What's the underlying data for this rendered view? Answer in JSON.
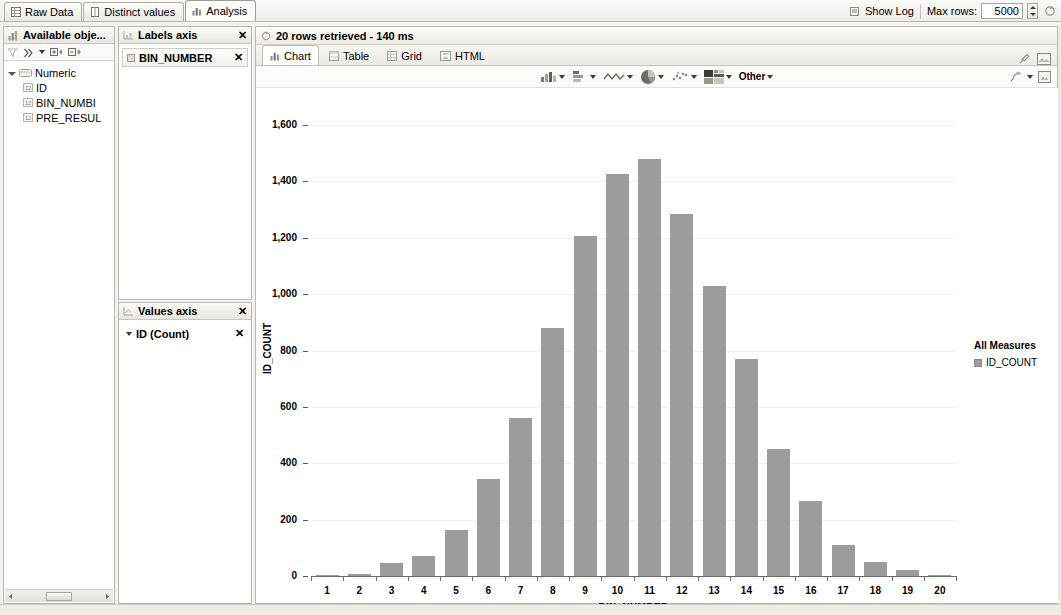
{
  "window": {
    "tabs": [
      {
        "label": "Raw Data",
        "icon": "grid-icon",
        "active": false
      },
      {
        "label": "Distinct values",
        "icon": "column-icon",
        "active": false
      },
      {
        "label": "Analysis",
        "icon": "bar-chart-icon",
        "active": true
      }
    ],
    "show_log_label": "Show Log",
    "max_rows_label": "Max rows:",
    "max_rows_value": "5000"
  },
  "available_objects": {
    "title": "Available obje...",
    "toolbar_icons": [
      "filter-icon",
      "sort-icon",
      "dropdown-caret-icon",
      "expand-all-icon",
      "collapse-all-icon"
    ],
    "tree": [
      {
        "label": "Numeric",
        "level": 1,
        "icon": "folder-icon",
        "expanded": true
      },
      {
        "label": "ID",
        "level": 2,
        "icon": "number-column-icon"
      },
      {
        "label": "BIN_NUMBI",
        "level": 2,
        "icon": "number-column-icon"
      },
      {
        "label": "PRE_RESUL",
        "level": 2,
        "icon": "number-column-icon"
      }
    ]
  },
  "labels_axis": {
    "title": "Labels axis",
    "close_label": "✕",
    "items": [
      {
        "label": "BIN_NUMBER",
        "remove_label": "✕"
      }
    ]
  },
  "values_axis": {
    "title": "Values axis",
    "close_label": "✕",
    "items": [
      {
        "label": "ID (Count)",
        "remove_label": "✕"
      }
    ]
  },
  "result": {
    "status": "20 rows retrieved - 140 ms",
    "status_icon": "refresh-icon",
    "tabs": [
      {
        "label": "Chart",
        "icon": "bar-chart-icon",
        "active": true
      },
      {
        "label": "Table",
        "icon": "table-icon",
        "active": false
      },
      {
        "label": "Grid",
        "icon": "grid-icon",
        "active": false
      },
      {
        "label": "HTML",
        "icon": "html-icon",
        "active": false
      }
    ],
    "tab_right_icons": [
      "pin-icon",
      "export-image-icon"
    ],
    "chart_toolbar": {
      "items": [
        {
          "icon": "bar-chart-icon",
          "has_caret": true
        },
        {
          "icon": "stacked-chart-icon",
          "has_caret": true
        },
        {
          "icon": "line-chart-icon",
          "has_caret": true
        },
        {
          "icon": "pie-chart-icon",
          "has_caret": true
        },
        {
          "icon": "scatter-chart-icon",
          "has_caret": true
        },
        {
          "icon": "heatmap-chart-icon",
          "has_caret": true
        }
      ],
      "other_label": "Other",
      "right_icons": [
        "settings-icon",
        "fullscreen-icon"
      ]
    }
  },
  "chart_data": {
    "type": "bar",
    "title": "",
    "xlabel": "BIN_NUMBER",
    "ylabel": "ID_COUNT",
    "categories": [
      "1",
      "2",
      "3",
      "4",
      "5",
      "6",
      "7",
      "8",
      "9",
      "10",
      "11",
      "12",
      "13",
      "14",
      "15",
      "16",
      "17",
      "18",
      "19",
      "20"
    ],
    "values": [
      3,
      8,
      45,
      70,
      165,
      345,
      560,
      880,
      1205,
      1425,
      1480,
      1285,
      1030,
      770,
      450,
      265,
      110,
      50,
      22,
      2
    ],
    "ylim": [
      0,
      1650
    ],
    "yticks": [
      0,
      200,
      400,
      600,
      800,
      1000,
      1200,
      1400,
      1600
    ],
    "ytick_labels": [
      "0",
      "200",
      "400",
      "600",
      "800",
      "1,000",
      "1,200",
      "1,400",
      "1,600"
    ],
    "grid": true,
    "bar_color": "#9c9c9c",
    "legend": {
      "position": "right",
      "title": "All Measures",
      "entries": [
        {
          "label": "ID_COUNT",
          "color": "#9c9c9c"
        }
      ]
    },
    "series": [
      {
        "name": "ID_COUNT",
        "values": [
          3,
          8,
          45,
          70,
          165,
          345,
          560,
          880,
          1205,
          1425,
          1480,
          1285,
          1030,
          770,
          450,
          265,
          110,
          50,
          22,
          2
        ]
      }
    ]
  }
}
